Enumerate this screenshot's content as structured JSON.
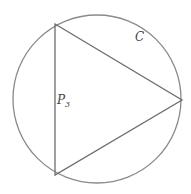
{
  "diagram": {
    "circle": {
      "label": "C",
      "cx": 97,
      "cy": 99,
      "r": 84,
      "stroke": "#8a8a8a"
    },
    "triangle": {
      "label": "P",
      "label_subscript": "3",
      "vertices": [
        [
          55,
          24
        ],
        [
          182,
          100
        ],
        [
          55,
          175
        ]
      ],
      "stroke": "#6e6e6e"
    },
    "labels": {
      "circle_label_pos": [
        135,
        40
      ],
      "polygon_label_pos": [
        57,
        104
      ]
    }
  }
}
